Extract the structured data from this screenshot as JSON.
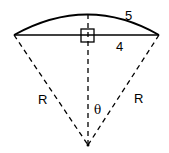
{
  "diagram": {
    "arc_label": "5",
    "chord_label": "4",
    "radius_left_label": "R",
    "radius_right_label": "R",
    "angle_label": "θ",
    "stroke_color": "#000000"
  }
}
